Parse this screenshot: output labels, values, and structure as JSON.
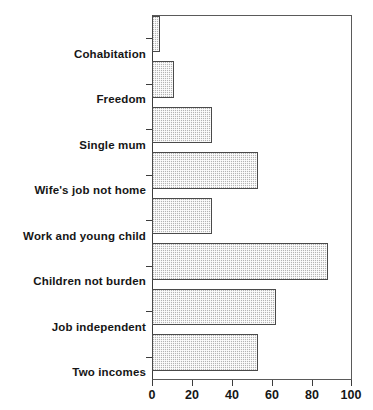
{
  "chart_data": {
    "type": "bar",
    "orientation": "horizontal",
    "title": "",
    "xlabel": "",
    "ylabel": "",
    "xlim": [
      0,
      100
    ],
    "xticks": [
      0,
      20,
      40,
      60,
      80,
      100
    ],
    "grid": false,
    "legend": false,
    "categories": [
      "Cohabitation",
      "Freedom",
      "Single mum",
      "Wife's job not home",
      "Work and young child",
      "Children not burden",
      "Job independent",
      "Two incomes"
    ],
    "values": [
      4,
      11,
      30,
      53,
      30,
      88,
      62,
      53
    ],
    "bar_fill_color": "#b4b4b4",
    "bar_edge_color": "#4a4a4a",
    "axis_color": "#3c3c3c",
    "background_color": "#ffffff"
  }
}
